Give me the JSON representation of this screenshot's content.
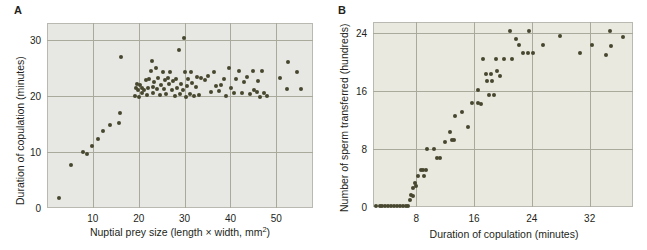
{
  "figure": {
    "panels": [
      {
        "letter": "A",
        "chart_data": {
          "type": "scatter",
          "title": "",
          "xlabel": "Nuptial prey size (length × width, mm2)",
          "xlabel_base": "Nuptial prey size (length × width, mm",
          "xlabel_sup": "2",
          "xlabel_tail": ")",
          "ylabel": "Duration of copulation (minutes)",
          "xticks": [
            10,
            20,
            30,
            40,
            50
          ],
          "yticks": [
            0,
            10,
            20,
            30
          ],
          "xlim": [
            0,
            58
          ],
          "ylim": [
            0,
            33
          ],
          "grid": true,
          "point_color": "#474730",
          "background": "#e7e7e3",
          "points": [
            [
              2.6,
              1.8
            ],
            [
              5.2,
              7.7
            ],
            [
              7.8,
              10.0
            ],
            [
              8.7,
              9.7
            ],
            [
              9.8,
              11.1
            ],
            [
              11.2,
              12.3
            ],
            [
              12.2,
              13.8
            ],
            [
              13.8,
              14.9
            ],
            [
              15.6,
              15.2
            ],
            [
              16.0,
              17.0
            ],
            [
              16.1,
              27.0
            ],
            [
              19.2,
              20.0
            ],
            [
              19.3,
              21.4
            ],
            [
              19.6,
              22.2
            ],
            [
              19.9,
              21.0
            ],
            [
              20.1,
              19.8
            ],
            [
              20.3,
              22.0
            ],
            [
              20.6,
              20.6
            ],
            [
              20.8,
              21.5
            ],
            [
              21.2,
              21.1
            ],
            [
              21.5,
              22.8
            ],
            [
              21.8,
              20.2
            ],
            [
              22.0,
              21.4
            ],
            [
              22.3,
              23.0
            ],
            [
              22.6,
              24.5
            ],
            [
              22.8,
              26.2
            ],
            [
              23.0,
              21.6
            ],
            [
              23.2,
              20.6
            ],
            [
              23.4,
              22.4
            ],
            [
              23.8,
              25.0
            ],
            [
              24.0,
              21.2
            ],
            [
              24.3,
              23.2
            ],
            [
              24.6,
              20.1
            ],
            [
              24.9,
              22.0
            ],
            [
              25.2,
              24.3
            ],
            [
              25.5,
              21.3
            ],
            [
              25.8,
              22.8
            ],
            [
              26.0,
              20.4
            ],
            [
              26.3,
              23.2
            ],
            [
              26.6,
              22.2
            ],
            [
              26.9,
              24.2
            ],
            [
              27.2,
              21.0
            ],
            [
              27.5,
              22.6
            ],
            [
              27.8,
              19.9
            ],
            [
              28.1,
              23.0
            ],
            [
              28.4,
              21.5
            ],
            [
              28.7,
              28.2
            ],
            [
              29.0,
              20.3
            ],
            [
              29.3,
              22.2
            ],
            [
              29.6,
              21.0
            ],
            [
              29.8,
              30.3
            ],
            [
              30.0,
              24.3
            ],
            [
              30.2,
              19.8
            ],
            [
              30.5,
              21.8
            ],
            [
              30.8,
              23.0
            ],
            [
              31.1,
              20.4
            ],
            [
              31.4,
              24.2
            ],
            [
              31.7,
              22.3
            ],
            [
              32.0,
              19.9
            ],
            [
              32.4,
              21.6
            ],
            [
              32.8,
              23.4
            ],
            [
              33.2,
              20.2
            ],
            [
              33.6,
              23.2
            ],
            [
              34.4,
              22.8
            ],
            [
              35.2,
              23.5
            ],
            [
              35.8,
              20.7
            ],
            [
              36.3,
              24.3
            ],
            [
              36.8,
              21.8
            ],
            [
              37.4,
              20.9
            ],
            [
              38.0,
              22.0
            ],
            [
              38.6,
              23.1
            ],
            [
              39.0,
              19.9
            ],
            [
              39.6,
              24.9
            ],
            [
              40.2,
              21.4
            ],
            [
              40.8,
              20.5
            ],
            [
              41.3,
              23.1
            ],
            [
              41.9,
              24.4
            ],
            [
              42.5,
              20.6
            ],
            [
              43.0,
              22.5
            ],
            [
              43.6,
              23.4
            ],
            [
              44.2,
              20.3
            ],
            [
              44.8,
              24.4
            ],
            [
              45.2,
              21.1
            ],
            [
              45.7,
              20.7
            ],
            [
              46.1,
              22.6
            ],
            [
              46.5,
              19.8
            ],
            [
              46.9,
              24.4
            ],
            [
              47.4,
              20.5
            ],
            [
              48.0,
              20.0
            ],
            [
              50.8,
              23.2
            ],
            [
              52.4,
              21.3
            ],
            [
              52.6,
              26.1
            ],
            [
              54.6,
              24.2
            ],
            [
              55.4,
              21.2
            ]
          ]
        }
      },
      {
        "letter": "B",
        "chart_data": {
          "type": "scatter",
          "title": "",
          "xlabel": "Duration of copulation (minutes)",
          "ylabel": "Number of sperm transferred (hundreds)",
          "xticks": [
            8,
            16,
            24,
            32
          ],
          "yticks": [
            0,
            8,
            16,
            24
          ],
          "xlim": [
            2,
            38
          ],
          "ylim": [
            0,
            25.5
          ],
          "grid": true,
          "point_color": "#474730",
          "background": "#e9e9df",
          "points": [
            [
              2.4,
              0.1
            ],
            [
              2.9,
              0.1
            ],
            [
              3.3,
              0.1
            ],
            [
              3.7,
              0.1
            ],
            [
              4.1,
              0.1
            ],
            [
              4.5,
              0.1
            ],
            [
              4.9,
              0.1
            ],
            [
              5.3,
              0.1
            ],
            [
              5.7,
              0.1
            ],
            [
              6.1,
              0.1
            ],
            [
              6.5,
              0.1
            ],
            [
              6.9,
              0.15
            ],
            [
              7.1,
              1.0
            ],
            [
              7.2,
              1.7
            ],
            [
              7.5,
              1.5
            ],
            [
              7.6,
              2.6
            ],
            [
              7.8,
              3.3
            ],
            [
              8.0,
              2.9
            ],
            [
              8.2,
              4.3
            ],
            [
              8.6,
              5.1
            ],
            [
              8.9,
              5.1
            ],
            [
              9.0,
              4.3
            ],
            [
              9.4,
              5.1
            ],
            [
              9.5,
              8.0
            ],
            [
              10.4,
              8.0
            ],
            [
              10.8,
              6.8
            ],
            [
              11.3,
              6.8
            ],
            [
              11.9,
              9.0
            ],
            [
              12.6,
              10.3
            ],
            [
              13.0,
              9.3
            ],
            [
              13.2,
              9.2
            ],
            [
              13.4,
              12.5
            ],
            [
              14.3,
              13.1
            ],
            [
              15.1,
              11.1
            ],
            [
              15.7,
              14.3
            ],
            [
              16.5,
              14.3
            ],
            [
              16.6,
              16.2
            ],
            [
              17.0,
              14.2
            ],
            [
              17.2,
              20.4
            ],
            [
              17.6,
              18.4
            ],
            [
              17.8,
              17.4
            ],
            [
              18.1,
              15.5
            ],
            [
              18.3,
              18.4
            ],
            [
              18.5,
              17.4
            ],
            [
              18.8,
              15.5
            ],
            [
              19.0,
              20.4
            ],
            [
              19.2,
              18.8
            ],
            [
              19.6,
              18.0
            ],
            [
              20.1,
              20.4
            ],
            [
              21.0,
              24.2
            ],
            [
              21.2,
              20.4
            ],
            [
              21.8,
              23.1
            ],
            [
              22.2,
              22.4
            ],
            [
              22.8,
              21.3
            ],
            [
              23.4,
              21.3
            ],
            [
              23.6,
              24.2
            ],
            [
              24.1,
              21.3
            ],
            [
              25.6,
              22.3
            ],
            [
              27.9,
              23.6
            ],
            [
              30.6,
              21.3
            ],
            [
              32.3,
              22.3
            ],
            [
              34.2,
              21.0
            ],
            [
              34.8,
              24.2
            ],
            [
              35.0,
              22.2
            ],
            [
              36.6,
              23.5
            ]
          ]
        }
      }
    ]
  }
}
